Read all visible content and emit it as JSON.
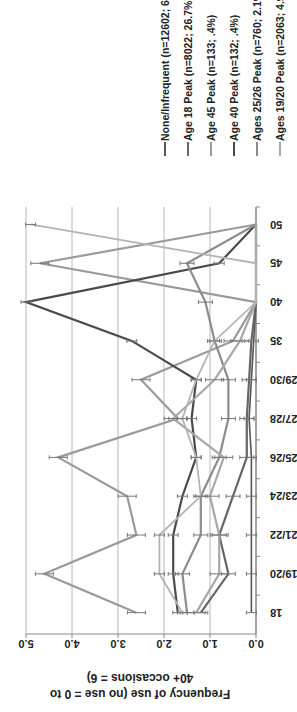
{
  "chart_data": {
    "type": "line",
    "title": "",
    "xlabel": "",
    "ylabel": "Frequency of use (no use = 0 to 40+ occasions = 6)",
    "ylabel_lines": [
      "Frequency of use (no use = 0 to",
      "40+ occasions = 6)"
    ],
    "ylim": [
      0,
      5
    ],
    "yticks": [
      "0.0",
      "1.0",
      "2.0",
      "3.0",
      "4.0",
      "5.0"
    ],
    "grid": true,
    "legend_position": "right",
    "error_bars": true,
    "rotation": "chart rotated 90 degrees counter-clockwise",
    "categories": [
      "18",
      "19/20",
      "21/22",
      "23/24",
      "25/26",
      "27/28",
      "29/30",
      "35",
      "40",
      "45",
      "50"
    ],
    "series": [
      {
        "name": "None/Infrequent (n=12602; 65.1%)",
        "color": "#555555",
        "width": 1.6,
        "values": [
          0.1,
          0.1,
          0.1,
          0.1,
          0.1,
          0.15,
          0.1,
          0.05,
          0.0,
          0.0,
          0.0
        ]
      },
      {
        "name": "Age 18 Peak (n=8022; 26.7%)",
        "color": "#666666",
        "width": 2.2,
        "values": [
          1.2,
          0.6,
          0.8,
          0.5,
          0.2,
          0.2,
          0.15,
          0.1,
          0.0,
          0.0,
          0.0
        ]
      },
      {
        "name": "Age 45 Peak (n=133; .4%)",
        "color": "#9a9a9a",
        "width": 2.2,
        "values": [
          2.6,
          4.6,
          2.6,
          2.8,
          4.3,
          1.7,
          2.5,
          0.5,
          0.0,
          4.7,
          0.0
        ]
      },
      {
        "name": "Age 40 Peak (n=132; .4%)",
        "color": "#4a4a4a",
        "width": 2.2,
        "values": [
          1.7,
          1.8,
          1.8,
          1.6,
          1.3,
          1.4,
          1.3,
          2.7,
          5.0,
          0.8,
          0.0
        ]
      },
      {
        "name": "Ages 25/26 Peak (n=760; 2.1%)",
        "color": "#8c8c8c",
        "width": 2.2,
        "values": [
          1.5,
          1.6,
          1.2,
          1.2,
          0.8,
          0.6,
          0.6,
          0.9,
          1.1,
          1.5,
          0.0
        ]
      },
      {
        "name": "Ages 19/20 Peak (n=2063; 4.9%)",
        "color": "#a8a8a8",
        "width": 2.2,
        "values": [
          1.3,
          0.8,
          0.8,
          1.0,
          0.7,
          1.8,
          0.9,
          0.35,
          0.0,
          0.0,
          0.0
        ]
      },
      {
        "name": "Age 50 Peak (n=89; .3%)",
        "color": "#b4b4b4",
        "width": 1.8,
        "values": [
          1.6,
          2.1,
          2.1,
          1.2,
          1.3,
          1.6,
          1.3,
          0.9,
          0.0,
          0.0,
          4.9
        ]
      }
    ]
  }
}
